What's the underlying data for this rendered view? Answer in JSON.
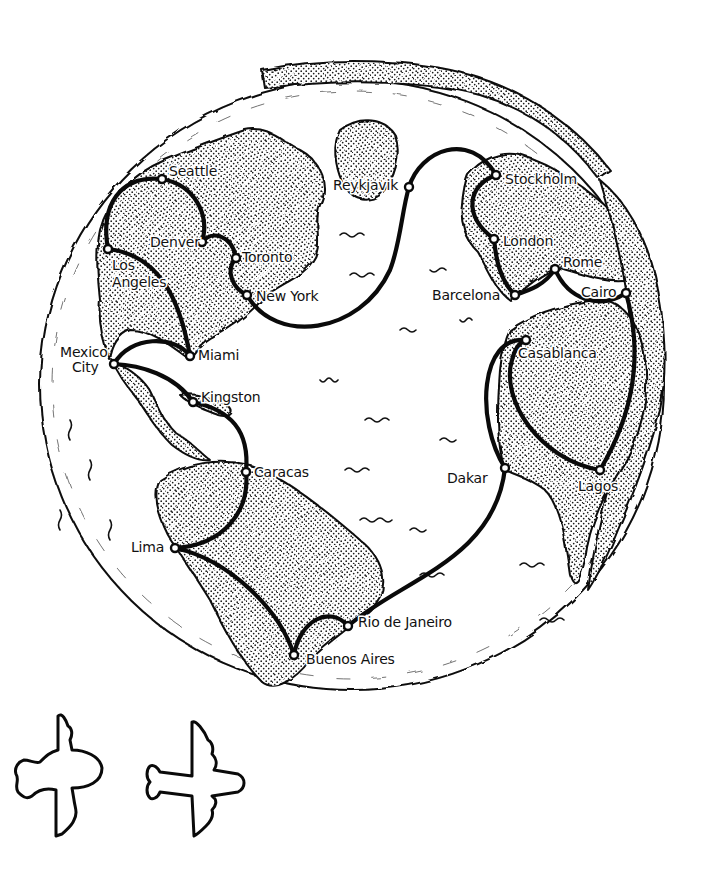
{
  "map": {
    "type": "hand-drawn globe route map",
    "colors": {
      "ink": "#0a0a0a",
      "paper": "#ffffff",
      "land_stipple": "#1a1a1a"
    },
    "cities": [
      {
        "id": "seattle",
        "label": "Seattle",
        "x": 162,
        "y": 179
      },
      {
        "id": "denver",
        "label": "Denver",
        "x": 202,
        "y": 242
      },
      {
        "id": "toronto",
        "label": "Toronto",
        "x": 236,
        "y": 258
      },
      {
        "id": "new-york",
        "label": "New York",
        "x": 247,
        "y": 295
      },
      {
        "id": "los-angeles",
        "label": "Los Angeles",
        "label_line1": "Los",
        "label_line2": "Angeles",
        "x": 108,
        "y": 249
      },
      {
        "id": "mexico-city",
        "label": "Mexico City",
        "label_line1": "Mexico",
        "label_line2": "City",
        "x": 114,
        "y": 364
      },
      {
        "id": "miami",
        "label": "Miami",
        "x": 190,
        "y": 356
      },
      {
        "id": "kingston",
        "label": "Kingston",
        "x": 193,
        "y": 402
      },
      {
        "id": "caracas",
        "label": "Caracas",
        "x": 246,
        "y": 472
      },
      {
        "id": "lima",
        "label": "Lima",
        "x": 175,
        "y": 548
      },
      {
        "id": "buenos-aires",
        "label": "Buenos Aires",
        "x": 294,
        "y": 655
      },
      {
        "id": "rio-de-janeiro",
        "label": "Rio de Janeiro",
        "x": 348,
        "y": 626
      },
      {
        "id": "reykjavik",
        "label": "Reykjavik",
        "x": 409,
        "y": 187
      },
      {
        "id": "stockholm",
        "label": "Stockholm",
        "x": 496,
        "y": 175
      },
      {
        "id": "london",
        "label": "London",
        "x": 494,
        "y": 239
      },
      {
        "id": "barcelona",
        "label": "Barcelona",
        "x": 515,
        "y": 295
      },
      {
        "id": "rome",
        "label": "Rome",
        "x": 555,
        "y": 269
      },
      {
        "id": "cairo",
        "label": "Cairo",
        "x": 626,
        "y": 293
      },
      {
        "id": "casablanca",
        "label": "Casablanca",
        "x": 526,
        "y": 340
      },
      {
        "id": "dakar",
        "label": "Dakar",
        "x": 505,
        "y": 468
      },
      {
        "id": "lagos",
        "label": "Lagos",
        "x": 600,
        "y": 470
      }
    ],
    "routes": [
      {
        "from": "Seattle",
        "to": "Los Angeles"
      },
      {
        "from": "Seattle",
        "to": "Denver"
      },
      {
        "from": "Denver",
        "to": "Toronto"
      },
      {
        "from": "Toronto",
        "to": "New York"
      },
      {
        "from": "New York",
        "to": "Reykjavik"
      },
      {
        "from": "Reykjavik",
        "to": "Stockholm"
      },
      {
        "from": "Stockholm",
        "to": "London"
      },
      {
        "from": "London",
        "to": "Barcelona"
      },
      {
        "from": "Barcelona",
        "to": "Rome"
      },
      {
        "from": "Rome",
        "to": "Cairo"
      },
      {
        "from": "Cairo",
        "to": "Lagos"
      },
      {
        "from": "Lagos",
        "to": "Casablanca"
      },
      {
        "from": "Casablanca",
        "to": "Dakar"
      },
      {
        "from": "Dakar",
        "to": "Rio de Janeiro"
      },
      {
        "from": "Rio de Janeiro",
        "to": "Buenos Aires"
      },
      {
        "from": "Buenos Aires",
        "to": "Lima"
      },
      {
        "from": "Lima",
        "to": "Caracas"
      },
      {
        "from": "Caracas",
        "to": "Kingston"
      },
      {
        "from": "Kingston",
        "to": "Mexico City"
      },
      {
        "from": "Mexico City",
        "to": "Miami"
      },
      {
        "from": "Miami",
        "to": "Los Angeles"
      }
    ]
  },
  "decorations": {
    "airplanes": [
      {
        "name": "small-propeller-plane",
        "x": 60,
        "y": 770
      },
      {
        "name": "long-airliner",
        "x": 195,
        "y": 780
      }
    ]
  }
}
